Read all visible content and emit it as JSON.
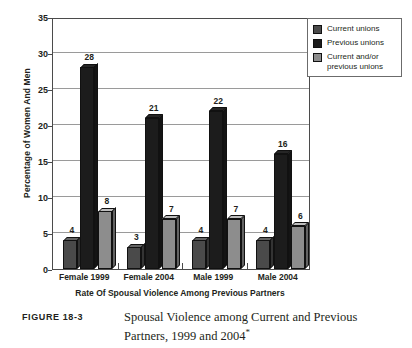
{
  "figure": {
    "label": "FIGURE 18-3",
    "caption_line1": "Spousal Violence among Current and Previous",
    "caption_line2": "Partners, 1999 and 2004",
    "caption_footnote_marker": "*"
  },
  "legend": {
    "position": "top-right",
    "items": [
      {
        "label": "Current unions",
        "color": "#4a4a4a"
      },
      {
        "label": "Previous unions",
        "color": "#1c1c1c"
      },
      {
        "label": "Current and/or previous unions",
        "color": "#8d8d8d"
      }
    ]
  },
  "axes": {
    "y_title": "Percentage of Women And Men",
    "x_title": "Rate Of Spousal Violence Among Previous Partners",
    "y_ticks": [
      "0",
      "5",
      "10",
      "15",
      "20",
      "25",
      "30",
      "35"
    ]
  },
  "chart_data": {
    "type": "bar",
    "xlabel": "Rate Of Spousal Violence Among Previous Partners",
    "ylabel": "Percentage of Women And Men",
    "ylim": [
      0,
      35
    ],
    "ytick_step": 5,
    "grid": true,
    "legend_position": "top-right",
    "categories": [
      "Female 1999",
      "Female 2004",
      "Male 1999",
      "Male 2004"
    ],
    "series": [
      {
        "name": "Current unions",
        "color": "#4a4a4a",
        "values": [
          4,
          3,
          4,
          4
        ]
      },
      {
        "name": "Previous unions",
        "color": "#1c1c1c",
        "values": [
          28,
          21,
          22,
          16
        ]
      },
      {
        "name": "Current and/or previous unions",
        "color": "#8d8d8d",
        "values": [
          8,
          7,
          7,
          6
        ]
      }
    ]
  }
}
